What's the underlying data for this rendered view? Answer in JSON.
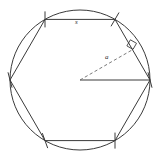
{
  "figure": {
    "background_color": "#ffffff",
    "stroke_color": "#3a3a3a",
    "dashed_color": "#6b6b6b",
    "label_color": "#2b2b2b",
    "canvas": {
      "width": 160,
      "height": 160
    }
  },
  "circle": {
    "name": "circumscribed-circle",
    "center": {
      "x": 80,
      "y": 80
    },
    "radius": 70,
    "stroke_width": 1
  },
  "hexagon": {
    "name": "regular-hexagon",
    "sides": 6,
    "vertices": [
      {
        "id": "v-right",
        "x": 150.0,
        "y": 80.0
      },
      {
        "id": "v-top-right",
        "x": 115.0,
        "y": 19.4
      },
      {
        "id": "v-top-left",
        "x": 45.0,
        "y": 19.4
      },
      {
        "id": "v-left",
        "x": 10.0,
        "y": 80.0
      },
      {
        "id": "v-bottom-left",
        "x": 45.0,
        "y": 140.6
      },
      {
        "id": "v-bottom-right",
        "x": 115.0,
        "y": 140.6
      }
    ]
  },
  "segments": {
    "radius": {
      "name": "radius-segment",
      "from": {
        "x": 80,
        "y": 80
      },
      "to": {
        "x": 150,
        "y": 80
      },
      "style": "solid"
    },
    "apothem": {
      "name": "apothem-segment",
      "from": {
        "x": 80,
        "y": 80
      },
      "to": {
        "x": 132.5,
        "y": 49.7
      },
      "style": "dashed"
    }
  },
  "right_angle_marker": {
    "name": "right-angle-marker",
    "at": {
      "x": 132.5,
      "y": 49.7
    },
    "size": 7
  },
  "vertex_ticks": {
    "name": "vertex-tick-marks",
    "length": 16,
    "marks": [
      {
        "id": "tick-top-left",
        "x": 45.0,
        "y": 19.4,
        "angle_deg": 90
      },
      {
        "id": "tick-top-right",
        "x": 115.0,
        "y": 19.4,
        "angle_deg": 60
      },
      {
        "id": "tick-right",
        "x": 150.0,
        "y": 80.0,
        "angle_deg": 75
      },
      {
        "id": "tick-bottom-right",
        "x": 115.0,
        "y": 140.6,
        "angle_deg": 90
      },
      {
        "id": "tick-bottom-left",
        "x": 45.0,
        "y": 140.6,
        "angle_deg": 70
      },
      {
        "id": "tick-left",
        "x": 10.0,
        "y": 80.0,
        "angle_deg": 75
      }
    ]
  },
  "labels": {
    "side": {
      "text": "s",
      "meaning": "side-length"
    },
    "apothem": {
      "text": "a",
      "meaning": "apothem"
    }
  }
}
